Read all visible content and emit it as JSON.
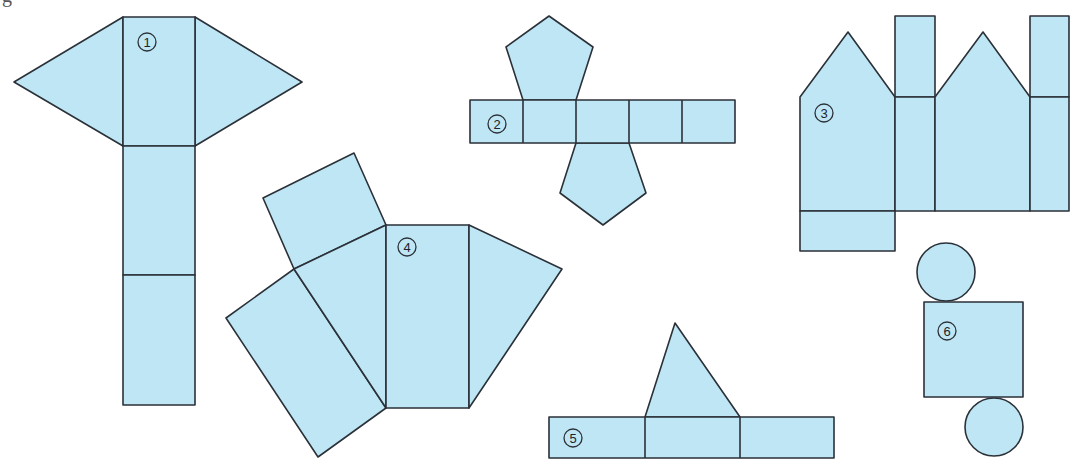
{
  "figure": {
    "corner_fragment": "g",
    "fill_color": "#bfe6f5",
    "stroke_color": "#2b3138",
    "nets": [
      {
        "id": 1,
        "label": "1",
        "description": "triangular-prism-like net: vertical strip of 3 rectangles with two triangles on the top rectangle"
      },
      {
        "id": 2,
        "label": "2",
        "description": "pentagonal prism net: strip of 5 squares with two pentagons"
      },
      {
        "id": 3,
        "label": "3",
        "description": "net of house-shaped prism with two pentagons and rectangles"
      },
      {
        "id": 4,
        "label": "4",
        "description": "fan-shaped net with rectangles and triangles"
      },
      {
        "id": 5,
        "label": "5",
        "description": "strip of 3 rectangles with one triangle on top"
      },
      {
        "id": 6,
        "label": "6",
        "description": "cylinder net: rectangle with two circles"
      }
    ]
  }
}
